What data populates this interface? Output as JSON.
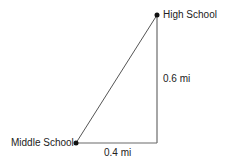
{
  "diagram": {
    "type": "right-triangle-map",
    "points": {
      "high_school": {
        "label": "High School"
      },
      "middle_school": {
        "label": "Middle School"
      }
    },
    "edges": {
      "vertical": {
        "label": "0.6 mi"
      },
      "horizontal": {
        "label": "0.4 mi"
      }
    },
    "colors": {
      "line": "#6b6b6b",
      "point": "#111111"
    }
  }
}
